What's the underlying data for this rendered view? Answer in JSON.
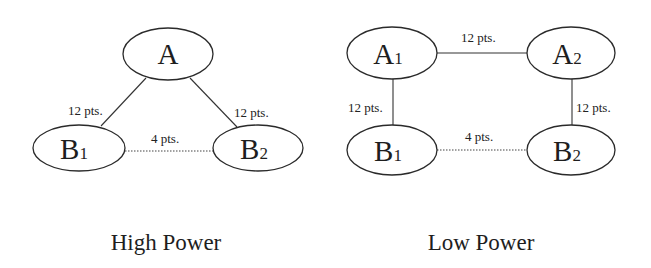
{
  "panels": [
    {
      "title": "High Power",
      "nodes": [
        {
          "id": "A",
          "label": "A",
          "sub": ""
        },
        {
          "id": "B1",
          "label": "B",
          "sub": "1"
        },
        {
          "id": "B2",
          "label": "B",
          "sub": "2"
        }
      ],
      "edges": [
        {
          "from": "A",
          "to": "B1",
          "style": "solid",
          "label": "12 pts."
        },
        {
          "from": "A",
          "to": "B2",
          "style": "solid",
          "label": "12 pts."
        },
        {
          "from": "B1",
          "to": "B2",
          "style": "dotted",
          "label": "4 pts."
        }
      ]
    },
    {
      "title": "Low Power",
      "nodes": [
        {
          "id": "A1",
          "label": "A",
          "sub": "1"
        },
        {
          "id": "A2",
          "label": "A",
          "sub": "2"
        },
        {
          "id": "B1",
          "label": "B",
          "sub": "1"
        },
        {
          "id": "B2",
          "label": "B",
          "sub": "2"
        }
      ],
      "edges": [
        {
          "from": "A1",
          "to": "A2",
          "style": "solid",
          "label": "12 pts."
        },
        {
          "from": "A1",
          "to": "B1",
          "style": "solid",
          "label": "12 pts."
        },
        {
          "from": "A2",
          "to": "B2",
          "style": "solid",
          "label": "12 pts."
        },
        {
          "from": "B1",
          "to": "B2",
          "style": "dotted",
          "label": "4 pts."
        }
      ]
    }
  ]
}
